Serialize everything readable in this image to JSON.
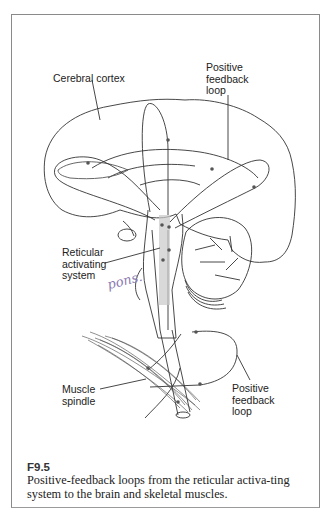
{
  "figure": {
    "labels": {
      "cerebral_cortex": "Cerebral cortex",
      "pfl_top": "Positive\nfeedback\nloop",
      "ras": "Reticular\nactivating\nsystem",
      "muscle_spindle": "Muscle\nspindle",
      "pfl_bottom": "Positive\nfeedback\nloop"
    },
    "handwriting": "pons.",
    "colors": {
      "frame": "#8a8a8a",
      "line": "#333333",
      "ras_shade": "#c9c9c9",
      "handwriting": "#8a7ab0"
    }
  },
  "caption": {
    "id": "F9.5",
    "text": "Positive-feedback loops from the reticular activa-ting system to the brain and skeletal muscles."
  }
}
